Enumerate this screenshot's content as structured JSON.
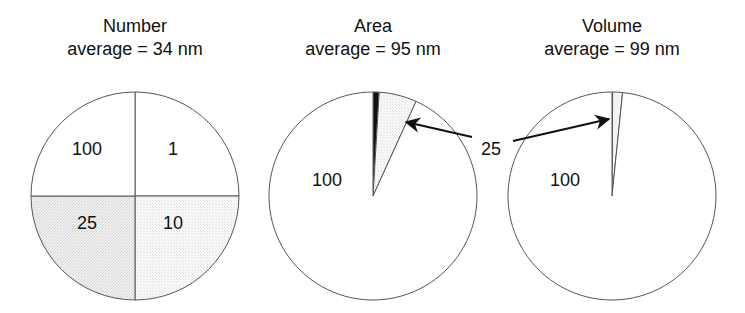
{
  "panels": [
    {
      "title": "Number",
      "subtitle": "average = 34 nm",
      "center": [
        135,
        196
      ],
      "radius": 104,
      "labels": [
        {
          "text": "100",
          "x": 87,
          "y": 155
        },
        {
          "text": "1",
          "x": 173,
          "y": 155
        },
        {
          "text": "25",
          "x": 87,
          "y": 229
        },
        {
          "text": "10",
          "x": 173,
          "y": 229
        }
      ]
    },
    {
      "title": "Area",
      "subtitle": "average = 95 nm",
      "center": [
        373,
        196
      ],
      "radius": 104,
      "labels": [
        {
          "text": "100",
          "x": 327,
          "y": 186
        }
      ]
    },
    {
      "title": "Volume",
      "subtitle": "average = 99 nm",
      "center": [
        612,
        196
      ],
      "radius": 104,
      "labels": [
        {
          "text": "100",
          "x": 565,
          "y": 186
        }
      ]
    }
  ],
  "callout": {
    "text": "25",
    "x": 491,
    "y": 155,
    "arrows": [
      {
        "from": [
          472,
          137
        ],
        "to": [
          406,
          122
        ]
      },
      {
        "from": [
          513,
          141
        ],
        "to": [
          609,
          119
        ]
      }
    ]
  },
  "colors": {
    "outline": "#555555",
    "stipple_dark": "#e9e9e9",
    "stipple_light": "#f4f4f4",
    "black_slice": "#111111",
    "background": "#ffffff"
  },
  "chart_data": [
    {
      "type": "pie",
      "title": "Number",
      "subtitle": "average = 34 nm",
      "categories": [
        "1 nm",
        "10 nm",
        "25 nm",
        "100 nm"
      ],
      "values": [
        25,
        25,
        25,
        25
      ],
      "slice_labels": [
        "1",
        "10",
        "25",
        "100"
      ],
      "start_angle_deg": 0,
      "direction": "clockwise"
    },
    {
      "type": "pie",
      "title": "Area",
      "subtitle": "average = 95 nm",
      "categories": [
        "1 nm",
        "10 nm",
        "25 nm",
        "100 nm"
      ],
      "values": [
        0.009,
        0.94,
        5.85,
        93.2
      ],
      "slice_labels": [
        "",
        "",
        "25",
        "100"
      ],
      "annotations": [
        "arrow from label 25 to 25 nm slice"
      ]
    },
    {
      "type": "pie",
      "title": "Volume",
      "subtitle": "average = 99 nm",
      "categories": [
        "1 nm",
        "10 nm",
        "25 nm",
        "100 nm"
      ],
      "values": [
        0.0001,
        0.098,
        1.53,
        98.37
      ],
      "slice_labels": [
        "",
        "",
        "25",
        "100"
      ],
      "annotations": [
        "arrow from label 25 to 25 nm slice"
      ]
    }
  ]
}
